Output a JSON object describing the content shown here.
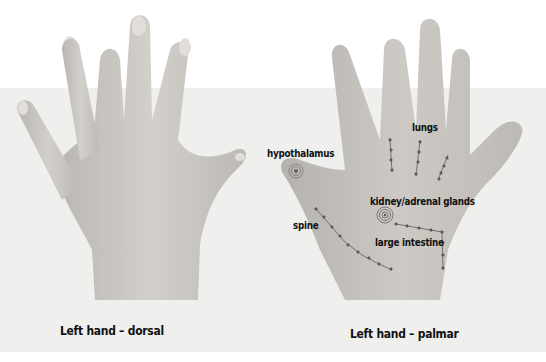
{
  "figure": {
    "panels": [
      {
        "id": "dorsal",
        "caption": "Left hand – dorsal"
      },
      {
        "id": "palmar",
        "caption": "Left hand – palmar",
        "points": [
          {
            "label": "hypothalamus"
          },
          {
            "label": "lungs"
          },
          {
            "label": "kidney/adrenal glands"
          },
          {
            "label": "spine"
          },
          {
            "label": "large intestine"
          }
        ]
      }
    ]
  },
  "colors": {
    "background_top": "#ffffff",
    "background_band": "#efefee",
    "skin": "#c9c6c2",
    "marker": "#5a5a5a",
    "text": "#111111"
  }
}
